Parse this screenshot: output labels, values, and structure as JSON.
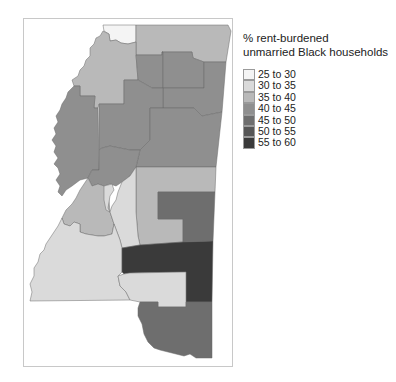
{
  "legend": {
    "title_line1": "% rent-burdened",
    "title_line2": "unmarried Black households",
    "items": [
      {
        "label": "25 to 30",
        "color": "#f4f4f4"
      },
      {
        "label": "30 to 35",
        "color": "#dadada"
      },
      {
        "label": "35 to 40",
        "color": "#b9b9b9"
      },
      {
        "label": "40 to 45",
        "color": "#8f8f8f"
      },
      {
        "label": "45 to 50",
        "color": "#6e6e6e"
      },
      {
        "label": "50 to 55",
        "color": "#565656"
      },
      {
        "label": "55 to 60",
        "color": "#3a3a3a"
      }
    ]
  },
  "map": {
    "title": "",
    "regions": [
      {
        "name": "north-west-tip",
        "class": "25 to 30",
        "fill": "#f4f4f4"
      },
      {
        "name": "north-east",
        "class": "35 to 40",
        "fill": "#b9b9b9"
      },
      {
        "name": "north-west-delta",
        "class": "35 to 40",
        "fill": "#b9b9b9"
      },
      {
        "name": "north-central-a",
        "class": "40 to 45",
        "fill": "#8f8f8f"
      },
      {
        "name": "north-central-b",
        "class": "40 to 45",
        "fill": "#8f8f8f"
      },
      {
        "name": "north-east-b",
        "class": "40 to 45",
        "fill": "#8f8f8f"
      },
      {
        "name": "delta-west",
        "class": "40 to 45",
        "fill": "#8f8f8f"
      },
      {
        "name": "central",
        "class": "40 to 45",
        "fill": "#8f8f8f"
      },
      {
        "name": "central-east",
        "class": "40 to 45",
        "fill": "#8f8f8f"
      },
      {
        "name": "central-west-block",
        "class": "40 to 45",
        "fill": "#8f8f8f"
      },
      {
        "name": "east-central-light",
        "class": "35 to 40",
        "fill": "#b9b9b9"
      },
      {
        "name": "east-central-dark",
        "class": "45 to 50",
        "fill": "#6e6e6e"
      },
      {
        "name": "warren",
        "class": "35 to 40",
        "fill": "#b9b9b9"
      },
      {
        "name": "jackson-west",
        "class": "30 to 35",
        "fill": "#dadada"
      },
      {
        "name": "jackson-east",
        "class": "30 to 35",
        "fill": "#dadada"
      },
      {
        "name": "south-west",
        "class": "30 to 35",
        "fill": "#dadada"
      },
      {
        "name": "south-central-dark",
        "class": "55 to 60",
        "fill": "#3a3a3a"
      },
      {
        "name": "south-central-light",
        "class": "30 to 35",
        "fill": "#dadada"
      },
      {
        "name": "gulf-coast",
        "class": "45 to 50",
        "fill": "#6e6e6e"
      }
    ]
  }
}
